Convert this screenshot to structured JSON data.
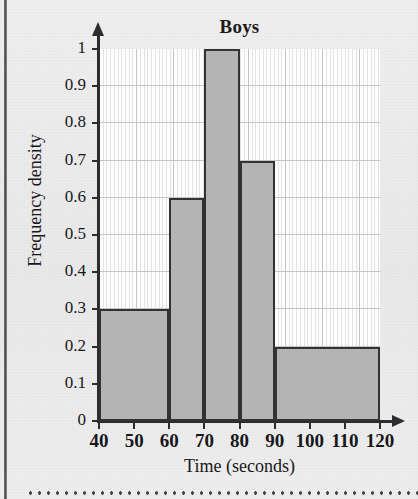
{
  "page": {
    "background_color": "#ececed",
    "left_rule_color": "#4c4c4e",
    "cut_line_color": "#4a4a4c"
  },
  "chart_data": {
    "type": "bar",
    "title": "Boys",
    "xlabel": "Time (seconds)",
    "ylabel": "Frequency density",
    "grid": true,
    "legend": null,
    "xlim": [
      40,
      120
    ],
    "ylim": [
      0,
      1
    ],
    "x_ticks": [
      40,
      50,
      60,
      70,
      80,
      90,
      100,
      110,
      120
    ],
    "x_tick_labels": [
      "40",
      "50",
      "60",
      "70",
      "80",
      "90",
      "100",
      "110",
      "120"
    ],
    "y_ticks": [
      0,
      0.1,
      0.2,
      0.3,
      0.4,
      0.5,
      0.6,
      0.7,
      0.8,
      0.9,
      1
    ],
    "y_tick_labels": [
      "0",
      "0.1",
      "0.2",
      "0.3",
      "0.4",
      "0.5",
      "0.6",
      "0.7",
      "0.8",
      "0.9",
      "1"
    ],
    "bar_fill_color": "#b4b4b4",
    "bar_edge_color": "#323234",
    "bins": [
      {
        "label": "40-60",
        "x_start": 40,
        "x_end": 60,
        "value": 0.3,
        "frequency": 6
      },
      {
        "label": "60-70",
        "x_start": 60,
        "x_end": 70,
        "value": 0.6,
        "frequency": 6
      },
      {
        "label": "70-80",
        "x_start": 70,
        "x_end": 80,
        "value": 1.0,
        "frequency": 10
      },
      {
        "label": "80-90",
        "x_start": 80,
        "x_end": 90,
        "value": 0.7,
        "frequency": 7
      },
      {
        "label": "90-120",
        "x_start": 90,
        "x_end": 120,
        "value": 0.2,
        "frequency": 6
      }
    ],
    "categories": [
      "40-60",
      "60-70",
      "70-80",
      "80-90",
      "90-120"
    ],
    "values": [
      0.3,
      0.6,
      1.0,
      0.7,
      0.2
    ]
  }
}
